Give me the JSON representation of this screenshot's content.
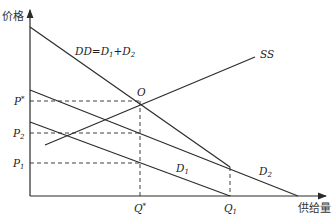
{
  "diagram": {
    "type": "supply-demand",
    "axes": {
      "y_label": "价格",
      "x_label": "供给量"
    },
    "curves": [
      {
        "id": "DD",
        "label": "DD=D",
        "label_sub1": "1",
        "label_mid": "+D",
        "label_sub2": "2"
      },
      {
        "id": "SS",
        "label": "SS"
      },
      {
        "id": "D1",
        "label": "D",
        "label_sub": "1"
      },
      {
        "id": "D2",
        "label": "D",
        "label_sub": "2"
      }
    ],
    "points": {
      "equilibrium": "O"
    },
    "price_ticks": [
      {
        "label": "P",
        "sup": "*"
      },
      {
        "label": "P",
        "sub": "2"
      },
      {
        "label": "P",
        "sub": "1"
      }
    ],
    "quantity_ticks": [
      {
        "label": "Q",
        "sup": "*"
      },
      {
        "label": "Q",
        "sub": "1"
      }
    ],
    "colors": {
      "line": "#2b2b2b",
      "text": "#333333"
    }
  }
}
